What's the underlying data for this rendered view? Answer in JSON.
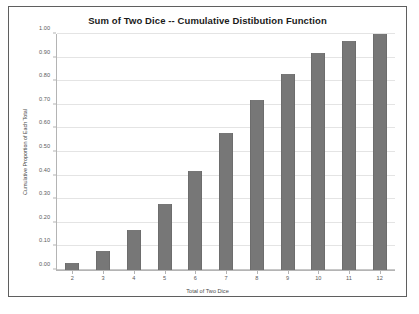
{
  "chart_data": {
    "type": "bar",
    "title": "Sum of Two Dice -- Cumulative Distibution Function",
    "xlabel": "Total of Two Dice",
    "ylabel": "Cumulative Proportion of Each Total",
    "categories": [
      "2",
      "3",
      "4",
      "5",
      "6",
      "7",
      "8",
      "9",
      "10",
      "11",
      "12"
    ],
    "values": [
      0.03,
      0.08,
      0.17,
      0.28,
      0.42,
      0.58,
      0.72,
      0.83,
      0.92,
      0.97,
      1.0
    ],
    "ylim": [
      0.0,
      1.0
    ],
    "ytick_labels": [
      "0.00",
      "0.10",
      "0.20",
      "0.30",
      "0.40",
      "0.50",
      "0.60",
      "0.70",
      "0.80",
      "0.90",
      "1.00"
    ],
    "ytick_values": [
      0.0,
      0.1,
      0.2,
      0.3,
      0.4,
      0.5,
      0.6,
      0.7,
      0.8,
      0.9,
      1.0
    ],
    "grid": true,
    "legend": null,
    "bar_color": "#777777",
    "gridline_color": "#e4e4e4",
    "axis_color": "#b4b4b4",
    "border_color": "#5f5f5f",
    "background_color": "#ffffff"
  }
}
